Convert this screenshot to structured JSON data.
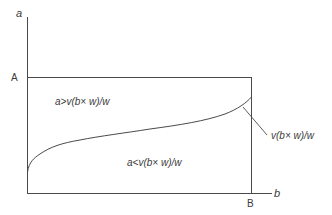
{
  "diagram": {
    "axes": {
      "y_label": "a",
      "x_label": "b",
      "y_marker": "A",
      "x_marker": "B"
    },
    "regions": {
      "upper": "a>v(b× w)/w",
      "lower": "a<v(b× w)/w"
    },
    "curve": {
      "label": "v(b× w)/w"
    },
    "colors": {
      "line": "#4a4a4a",
      "text": "#3a3a3a",
      "background": "#ffffff"
    }
  }
}
